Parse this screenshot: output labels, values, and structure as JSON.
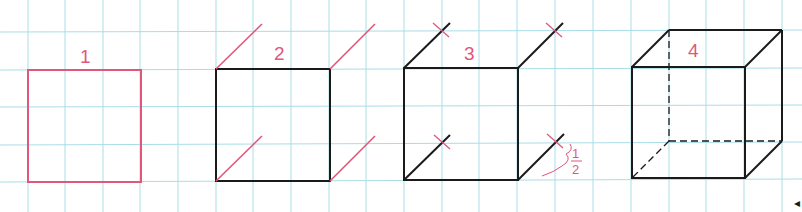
{
  "figure": {
    "colors": {
      "grid": "#a9dde6",
      "pink": "#e0577a",
      "ink": "#1a1a1a",
      "label": "#e0577a"
    },
    "steps": [
      {
        "id": 1,
        "label": "1"
      },
      {
        "id": 2,
        "label": "2"
      },
      {
        "id": 3,
        "label": "3",
        "annotation_numerator": "1",
        "annotation_denominator": "2"
      },
      {
        "id": 4,
        "label": "4"
      }
    ],
    "arrow_glyph": "◂"
  }
}
